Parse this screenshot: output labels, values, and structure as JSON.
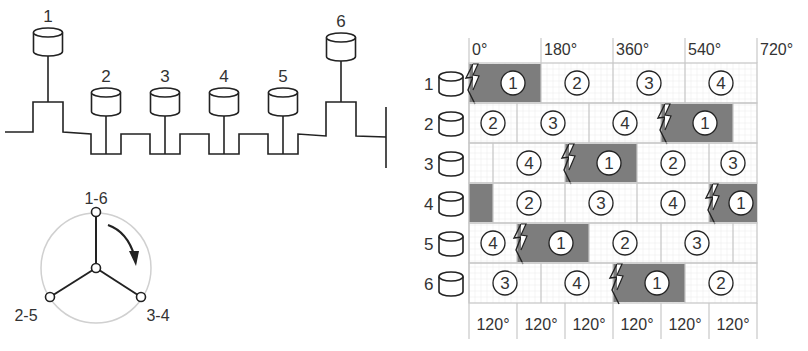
{
  "crankshaft": {
    "cylinders": [
      {
        "label": "1",
        "x": 48,
        "raised": true
      },
      {
        "label": "2",
        "x": 106,
        "raised": false
      },
      {
        "label": "3",
        "x": 165,
        "raised": false
      },
      {
        "label": "4",
        "x": 224,
        "raised": false
      },
      {
        "label": "5",
        "x": 283,
        "raised": false
      },
      {
        "label": "6",
        "x": 341,
        "raised": true
      }
    ]
  },
  "crank_star": {
    "labels": {
      "top": "1-6",
      "bottom_left": "2-5",
      "bottom_right": "3-4"
    },
    "rotation": "clockwise"
  },
  "firing_chart": {
    "degree_ticks": [
      "0°",
      "180°",
      "360°",
      "540°",
      "720°"
    ],
    "bottom_intervals": [
      "120°",
      "120°",
      "120°",
      "120°",
      "120°",
      "120°"
    ],
    "stroke_labels": [
      "1",
      "2",
      "3",
      "4"
    ],
    "rows": [
      {
        "cylinder": "1",
        "power_start_deg": 0
      },
      {
        "cylinder": "2",
        "power_start_deg": 480
      },
      {
        "cylinder": "3",
        "power_start_deg": 240
      },
      {
        "cylinder": "4",
        "power_start_deg": 600
      },
      {
        "cylinder": "5",
        "power_start_deg": 120
      },
      {
        "cylinder": "6",
        "power_start_deg": 360
      }
    ],
    "colors": {
      "power": "#7d7d7d",
      "grid": "#c8c8c8",
      "line": "#222222"
    }
  }
}
